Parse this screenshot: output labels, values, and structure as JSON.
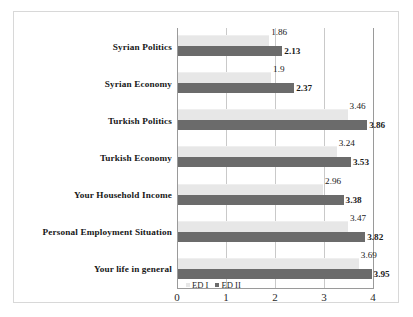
{
  "chart_data": {
    "type": "bar",
    "orientation": "horizontal",
    "title": "",
    "xlabel": "",
    "ylabel": "",
    "xlim": [
      0,
      4
    ],
    "xticks": [
      "0",
      "1",
      "2",
      "3",
      "4"
    ],
    "grid": true,
    "legend_position": "bottom-left",
    "categories": [
      "Syrian Politics",
      "Syrian Economy",
      "Turkish Politics",
      "Turkish Economy",
      "Your Household Income",
      "Personal Employment Situation",
      "Your life in general"
    ],
    "series": [
      {
        "name": "ED I",
        "color": "#e7e7e7",
        "values": [
          1.86,
          1.9,
          3.46,
          3.24,
          2.96,
          3.47,
          3.69
        ],
        "labels": [
          "1.86",
          "1.9",
          "3.46",
          "3.24",
          "2.96",
          "3.47",
          "3.69"
        ]
      },
      {
        "name": "ED II",
        "color": "#6b6b6b",
        "values": [
          2.13,
          2.37,
          3.86,
          3.53,
          3.38,
          3.82,
          3.95
        ],
        "labels": [
          "2.13",
          "2.37",
          "3.86",
          "3.53",
          "3.38",
          "3.82",
          "3.95"
        ]
      }
    ]
  }
}
